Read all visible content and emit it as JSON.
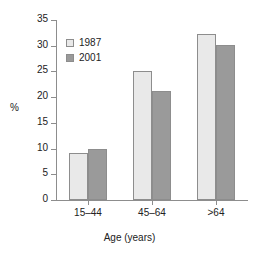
{
  "chart_data": {
    "type": "bar",
    "title": "",
    "subtitle": "",
    "xlabel": "Age (years)",
    "ylabel": "%",
    "categories": [
      "15–44",
      "45–64",
      ">64"
    ],
    "series": [
      {
        "name": "1987",
        "values": [
          9.2,
          25.0,
          32.2
        ],
        "color": "#e9e9e9"
      },
      {
        "name": "2001",
        "values": [
          10.0,
          21.2,
          30.2
        ],
        "color": "#9a9a9a"
      }
    ],
    "ylim": [
      0,
      35
    ],
    "yticks": [
      0,
      5,
      10,
      15,
      20,
      25,
      30,
      35
    ],
    "ytick_labels": [
      "0",
      "5",
      "10",
      "15",
      "20",
      "25",
      "30",
      "35"
    ],
    "grid": false,
    "legend_position": "top-left",
    "bar_border_color": "#8d8d8d",
    "axis_color": "#8d8d8d",
    "text_color": "#222222",
    "background": "#ffffff"
  }
}
